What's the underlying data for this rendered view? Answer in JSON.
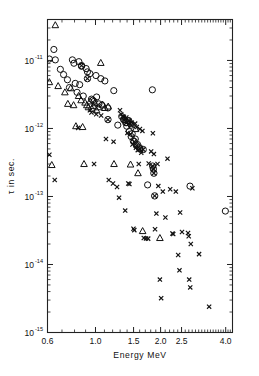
{
  "chart_data": {
    "type": "scatter",
    "title": "",
    "xlabel": "Energy  MeV",
    "ylabel": "τ in sec.",
    "xscale": "log",
    "yscale": "log",
    "xlim": [
      0.6,
      4.3
    ],
    "ylim": [
      1e-15,
      4e-11
    ],
    "grid": false,
    "legend": "none",
    "xticks_labeled": [
      {
        "value": 0.6,
        "label": "0.6"
      },
      {
        "value": 1.0,
        "label": "1.0"
      },
      {
        "value": 1.5,
        "label": "1.5"
      },
      {
        "value": 2.0,
        "label": "2.0"
      },
      {
        "value": 2.5,
        "label": "2.5"
      },
      {
        "value": 4.0,
        "label": "4.0"
      }
    ],
    "yticks_labeled": [
      {
        "value": 1e-11,
        "mantissa": "10",
        "exponent": "-11"
      },
      {
        "value": 1e-12,
        "mantissa": "10",
        "exponent": "-12"
      },
      {
        "value": 1e-13,
        "mantissa": "10",
        "exponent": "-13"
      },
      {
        "value": 1e-14,
        "mantissa": "10",
        "exponent": "-14"
      },
      {
        "value": 1e-15,
        "mantissa": "10",
        "exponent": "-15"
      }
    ],
    "series": [
      {
        "name": "circle",
        "marker": "open-circle",
        "points": [
          [
            0.612,
            1.05e-11
          ],
          [
            0.642,
            1.45e-11
          ],
          [
            0.652,
            1.02e-11
          ],
          [
            0.688,
            7.4e-12
          ],
          [
            0.712,
            6.2e-12
          ],
          [
            0.742,
            5.2e-12
          ],
          [
            0.758,
            4e-12
          ],
          [
            0.782,
            1.02e-11
          ],
          [
            0.795,
            9.1e-12
          ],
          [
            0.806,
            4.6e-12
          ],
          [
            0.822,
            3.4e-12
          ],
          [
            0.838,
            9.6e-12
          ],
          [
            0.845,
            4.4e-12
          ],
          [
            0.862,
            8.2e-12
          ],
          [
            0.878,
            3e-12
          ],
          [
            0.905,
            7.6e-12
          ],
          [
            0.918,
            6.8e-12
          ],
          [
            0.942,
            6.4e-12
          ],
          [
            0.958,
            2.7e-12
          ],
          [
            0.972,
            2.6e-12
          ],
          [
            0.985,
            2.5e-12
          ],
          [
            1.005,
            6e-12
          ],
          [
            1.012,
            2.9e-12
          ],
          [
            1.038,
            2.3e-12
          ],
          [
            1.058,
            5.4e-12
          ],
          [
            1.072,
            2.2e-12
          ],
          [
            1.105,
            5e-12
          ],
          [
            1.142,
            2e-12
          ],
          [
            1.215,
            3.6e-12
          ],
          [
            1.268,
            1.12e-12
          ],
          [
            1.322,
            1.5e-12
          ],
          [
            1.352,
            1.35e-12
          ],
          [
            1.378,
            1.22e-12
          ],
          [
            1.395,
            1.08e-12
          ],
          [
            1.412,
            1.3e-12
          ],
          [
            1.432,
            9e-13
          ],
          [
            1.448,
            1.18e-12
          ],
          [
            1.462,
            7.6e-13
          ],
          [
            1.478,
            8.4e-13
          ],
          [
            1.495,
            6.6e-13
          ],
          [
            1.528,
            7e-13
          ],
          [
            1.565,
            5.8e-13
          ],
          [
            1.602,
            5.2e-13
          ],
          [
            1.832,
            3.7e-12
          ],
          [
            1.742,
            1.48e-13
          ],
          [
            2.735,
            1.42e-13
          ],
          [
            3.985,
            6.1e-14
          ]
        ]
      },
      {
        "name": "triangle",
        "marker": "open-triangle",
        "points": [
          [
            0.652,
            3.3e-11
          ],
          [
            0.612,
            4.8e-12
          ],
          [
            0.672,
            4.2e-12
          ],
          [
            0.722,
            3.4e-12
          ],
          [
            0.745,
            2.3e-12
          ],
          [
            0.768,
            3.9e-12
          ],
          [
            0.792,
            2.2e-12
          ],
          [
            0.812,
            1.08e-12
          ],
          [
            0.835,
            3e-12
          ],
          [
            0.858,
            2.6e-12
          ],
          [
            0.872,
            1.05e-12
          ],
          [
            0.895,
            2.4e-12
          ],
          [
            0.912,
            2.2e-12
          ],
          [
            0.928,
            2.05e-12
          ],
          [
            0.945,
            2.5e-12
          ],
          [
            0.962,
            1.95e-12
          ],
          [
            0.978,
            2.15e-12
          ],
          [
            0.995,
            2.35e-12
          ],
          [
            1.012,
            1.85e-12
          ],
          [
            1.032,
            2.05e-12
          ],
          [
            1.058,
            9.2e-12
          ],
          [
            1.078,
            2.25e-12
          ],
          [
            1.105,
            2e-12
          ],
          [
            1.145,
            2.1e-12
          ],
          [
            0.628,
            2.9e-13
          ],
          [
            0.885,
            3e-13
          ],
          [
            1.218,
            3e-13
          ],
          [
            1.452,
            2.95e-13
          ],
          [
            1.532,
            9.8e-13
          ],
          [
            1.572,
            2.2e-13
          ],
          [
            1.652,
            3.1e-14
          ],
          [
            1.985,
            2.45e-14
          ]
        ]
      },
      {
        "name": "cross",
        "marker": "x-cross",
        "points": [
          [
            0.612,
            4.1e-13
          ],
          [
            0.648,
            1.75e-13
          ],
          [
            0.832,
            1.02e-12
          ],
          [
            0.942,
            1.85e-12
          ],
          [
            0.958,
            1.72e-12
          ],
          [
            1.008,
            1.62e-12
          ],
          [
            0.985,
            3e-13
          ],
          [
            1.062,
            1.55e-12
          ],
          [
            1.118,
            7e-13
          ],
          [
            1.152,
            1.75e-13
          ],
          [
            1.205,
            1.55e-13
          ],
          [
            1.212,
            6.4e-13
          ],
          [
            1.258,
            1.38e-13
          ],
          [
            1.285,
            9.6e-14
          ],
          [
            1.298,
            1.85e-12
          ],
          [
            1.315,
            1.62e-12
          ],
          [
            1.332,
            1.5e-12
          ],
          [
            1.352,
            1.48e-12
          ],
          [
            1.372,
            6.2e-14
          ],
          [
            1.388,
            1.45e-12
          ],
          [
            1.405,
            8.6e-13
          ],
          [
            1.418,
            1.55e-13
          ],
          [
            1.435,
            1.52e-13
          ],
          [
            1.452,
            8.2e-13
          ],
          [
            1.468,
            1.22e-12
          ],
          [
            1.482,
            5.8e-13
          ],
          [
            1.498,
            3.35e-14
          ],
          [
            1.512,
            3.2e-14
          ],
          [
            1.525,
            1.18e-12
          ],
          [
            1.538,
            5.2e-13
          ],
          [
            1.552,
            1.05e-12
          ],
          [
            1.568,
            4.8e-13
          ],
          [
            1.585,
            3e-13
          ],
          [
            1.605,
            9.8e-13
          ],
          [
            1.628,
            4.4e-13
          ],
          [
            1.648,
            9.2e-13
          ],
          [
            1.672,
            2.45e-14
          ],
          [
            1.712,
            2.42e-14
          ],
          [
            1.752,
            2.4e-14
          ],
          [
            1.808,
            4.6e-13
          ],
          [
            1.842,
            8.5e-13
          ],
          [
            1.862,
            4.2e-13
          ],
          [
            1.885,
            3.3e-14
          ],
          [
            1.912,
            5.6e-14
          ],
          [
            1.952,
            1.42e-13
          ],
          [
            1.985,
            6e-15
          ],
          [
            2.012,
            3.2e-15
          ],
          [
            2.048,
            1.18e-13
          ],
          [
            2.105,
            4.9e-14
          ],
          [
            2.152,
            3.6e-13
          ],
          [
            2.215,
            1.28e-13
          ],
          [
            2.268,
            2.85e-14
          ],
          [
            2.288,
            2.8e-14
          ],
          [
            2.352,
            1.18e-13
          ],
          [
            2.412,
            1.38e-14
          ],
          [
            2.445,
            8.2e-15
          ],
          [
            2.462,
            5.8e-14
          ],
          [
            2.512,
            3e-14
          ],
          [
            2.678,
            2.9e-14
          ],
          [
            2.698,
            2.6e-14
          ],
          [
            2.712,
            6e-15
          ],
          [
            2.742,
            4.6e-15
          ],
          [
            2.758,
            2e-14
          ],
          [
            2.805,
            1.32e-13
          ],
          [
            3.012,
            1.42e-14
          ],
          [
            3.352,
            2.4e-15
          ],
          [
            1.762,
            3.05e-13
          ],
          [
            1.935,
            3e-13
          ]
        ]
      },
      {
        "name": "circled-cross",
        "marker": "circle-with-x",
        "points": [
          [
            0.862,
            8.4e-12
          ],
          [
            0.918,
            5.4e-12
          ],
          [
            1.142,
            1.35e-12
          ],
          [
            1.352,
            1.35e-12
          ],
          [
            1.392,
            1.22e-12
          ],
          [
            1.425,
            1.3e-12
          ],
          [
            1.462,
            1.12e-12
          ],
          [
            1.512,
            6.4e-13
          ],
          [
            1.548,
            5.6e-13
          ],
          [
            1.605,
            5e-13
          ],
          [
            1.662,
            4.9e-13
          ],
          [
            1.838,
            2.8e-13
          ],
          [
            1.852,
            2.55e-13
          ],
          [
            1.862,
            2.2e-13
          ],
          [
            1.878,
            1.02e-13
          ]
        ]
      }
    ]
  }
}
